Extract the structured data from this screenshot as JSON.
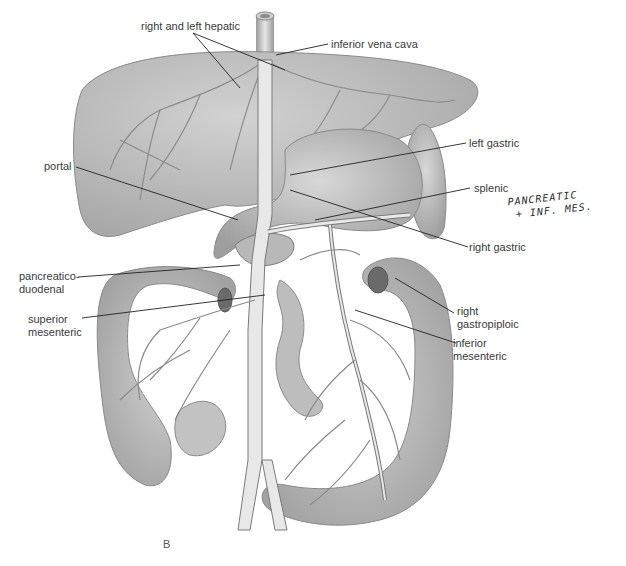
{
  "figure": {
    "panel_letter": "B",
    "labels": {
      "right_and_left_hepatic": "right and left hepatic",
      "inferior_vena_cava": "inferior vena cava",
      "left_gastric": "left gastric",
      "portal": "portal",
      "splenic": "splenic",
      "right_gastric": "right gastric",
      "pancreaticoduodenal": "pancreatico-\nduodenal",
      "right_gastropiploic": "right\ngastropiploic",
      "superior_mesenteric": "superior\nmesenteric",
      "inferior_mesenteric": "inferior\nmesenteric"
    },
    "handwritten_note": "PANCREATIC\n + INF. MES."
  },
  "colors": {
    "organ_fill": "#c8c8c8",
    "organ_dark": "#a9a9a9",
    "vessel_fill": "#e2e2e2",
    "vessel_stroke": "#7a7a7a",
    "leader_line": "#222222",
    "background": "#ffffff"
  }
}
